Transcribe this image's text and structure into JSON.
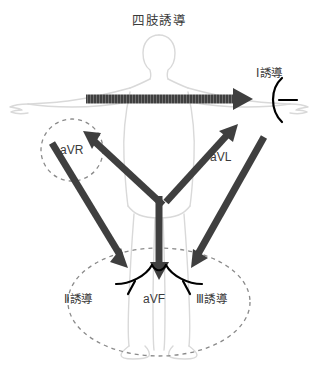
{
  "figure": {
    "title": "四肢誘導",
    "description_type": "ecg-limb-leads-diagram",
    "background_color": "#ffffff",
    "body_outline_color": "#d9d9d9",
    "arrow_color": "#3f3f3f",
    "electrode_color": "#000000",
    "dashed_circle_color": "#808080",
    "text_color": "#3b3b3b"
  },
  "labels": {
    "lead_1": "Ⅰ誘導",
    "avr": "aVR",
    "avl": "aVL",
    "lead_2": "Ⅱ誘導",
    "avf": "aVF",
    "lead_3": "Ⅲ誘導"
  },
  "icons": {
    "arrow_lead1": "right-arrow-icon",
    "arrow_avr": "up-left-arrow-icon",
    "arrow_avl": "up-right-arrow-icon",
    "arrow_lead2": "down-left-arrow-icon",
    "arrow_lead3": "down-right-arrow-icon",
    "arrow_avf": "down-arrow-icon",
    "electrode_lead1": "electrode-arc-icon",
    "electrode_lead2": "electrode-arc-icon",
    "electrode_lead3": "electrode-arc-icon",
    "electrode_avf": "electrode-arc-icon",
    "region_avr": "dashed-circle-icon",
    "region_legs": "dashed-ellipse-icon",
    "human_body": "human-body-silhouette-icon"
  }
}
